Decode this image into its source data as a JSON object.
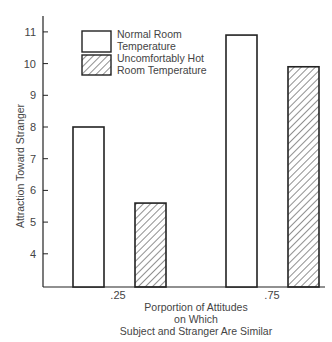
{
  "chart_data": {
    "type": "bar",
    "title": "",
    "xlabel": "Porportion of Attitudes\non Which\nSubject and Stranger Are Similar",
    "xlabel_lines": [
      "Porportion of Attitudes",
      "on Which",
      "Subject and Stranger Are Similar"
    ],
    "ylabel": "Attraction Toward Stranger",
    "categories": [
      ".25",
      ".75"
    ],
    "series": [
      {
        "name": "Normal Room Temperature",
        "pattern": "none",
        "values": [
          8.0,
          10.9
        ]
      },
      {
        "name": "Uncomfortably Hot Room Temperature",
        "pattern": "hatched",
        "values": [
          5.6,
          9.9
        ]
      }
    ],
    "yticks": [
      4,
      5,
      6,
      7,
      8,
      9,
      10,
      11
    ],
    "ylim": [
      3,
      11.5
    ],
    "grid": false,
    "legend_position": "top-left inside plot",
    "legend": [
      {
        "lines": [
          "Normal Room",
          "Temperature"
        ],
        "pattern": "none"
      },
      {
        "lines": [
          "Uncomfortably Hot",
          "Room Temperature"
        ],
        "pattern": "hatched"
      }
    ]
  },
  "colors": {
    "ink": "#222222",
    "text": "#444444",
    "background": "#ffffff"
  }
}
